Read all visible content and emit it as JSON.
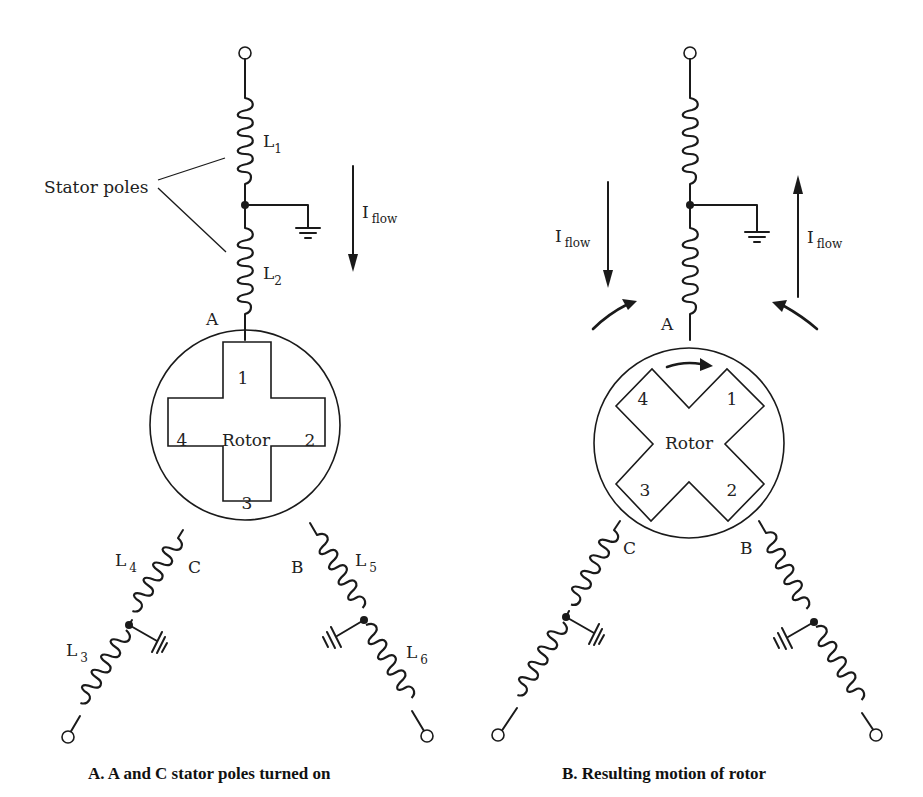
{
  "panels": [
    {
      "id": "A",
      "caption": "A.  A and C stator poles turned on",
      "annotation": "Stator poles",
      "pole_labels": {
        "top": "A",
        "left": "C",
        "right": "B"
      },
      "inductors": {
        "L1": "L",
        "L1_sub": "1",
        "L2": "L",
        "L2_sub": "2",
        "L3": "L",
        "L3_sub": "3",
        "L4": "L",
        "L4_sub": "4",
        "L5": "L",
        "L5_sub": "5",
        "L6": "L",
        "L6_sub": "6"
      },
      "current_labels": [
        {
          "main": "I",
          "sub": "flow",
          "direction": "down"
        }
      ],
      "rotor": {
        "label": "Rotor",
        "shape": "plus",
        "poles": [
          "1",
          "2",
          "3",
          "4"
        ]
      }
    },
    {
      "id": "B",
      "caption": "B.  Resulting motion of rotor",
      "pole_labels": {
        "top": "A",
        "left": "C",
        "right": "B"
      },
      "current_labels": [
        {
          "main": "I",
          "sub": "flow",
          "direction": "down"
        },
        {
          "main": "I",
          "sub": "flow",
          "direction": "up"
        }
      ],
      "rotor": {
        "label": "Rotor",
        "shape": "x",
        "poles": [
          "1",
          "2",
          "3",
          "4"
        ],
        "rotation": "clockwise"
      }
    }
  ]
}
